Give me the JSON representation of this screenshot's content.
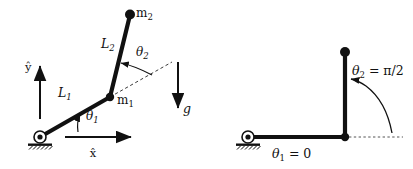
{
  "figure": {
    "background_color": "#ffffff",
    "link_color": "#111111",
    "mass_color": "#111111",
    "dashed_color": "#444444",
    "width": 413,
    "height": 169
  },
  "left_diagram": {
    "name": "general-configuration",
    "labels": {
      "mass_1": "m",
      "mass_1_sub": "1",
      "mass_2": "m",
      "mass_2_sub": "2",
      "link_1": "L",
      "link_1_sub": "1",
      "link_2": "L",
      "link_2_sub": "2",
      "theta_1": "θ",
      "theta_1_sub": "1",
      "theta_2": "θ",
      "theta_2_sub": "2",
      "axis_x": "x̂",
      "axis_y": "ŷ",
      "gravity": "g"
    },
    "geometry": {
      "pivot": [
        40,
        137
      ],
      "joint_m1": [
        110,
        97
      ],
      "tip_m2": [
        130,
        14
      ],
      "x_axis_start": [
        65,
        137
      ],
      "x_axis_end": [
        136,
        137
      ],
      "y_axis_start": [
        40,
        119
      ],
      "y_axis_end": [
        40,
        61
      ],
      "gravity_arrow_start": [
        178,
        62
      ],
      "gravity_arrow_end": [
        178,
        112
      ],
      "theta_1_deg": 30,
      "theta_2_deg": 46
    }
  },
  "right_diagram": {
    "name": "reference-configuration",
    "labels": {
      "theta_1_eq": "θ",
      "theta_1_eq_sub": "1",
      "theta_1_eq_value": " = 0",
      "theta_2_eq": "θ",
      "theta_2_eq_sub": "2",
      "theta_2_eq_value": " = π/2"
    },
    "geometry": {
      "pivot": [
        248,
        137
      ],
      "joint": [
        345,
        137
      ],
      "tip": [
        345,
        52
      ],
      "dotted_end": [
        403,
        137
      ],
      "theta_1_value_deg": 0,
      "theta_2_value_deg": 90
    }
  }
}
